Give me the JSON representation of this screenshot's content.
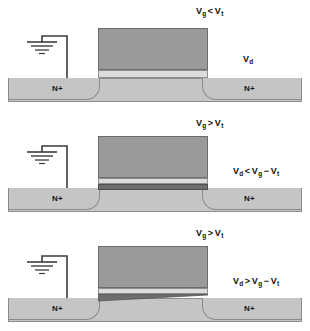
{
  "figure": {
    "colors": {
      "gate": "#9a9a9a",
      "oxide": "#dcdcdc",
      "substrate": "#c5c5c5",
      "channel": "#6e6e6e",
      "outline": "#8a8a8a",
      "background": "#ffffff"
    }
  },
  "panels": [
    {
      "id": "cutoff",
      "source_label": "N+",
      "drain_label": "N+",
      "gate_condition": {
        "v_gate": "V",
        "v_gate_sub": "g",
        "operator": "<",
        "v_thresh": "V",
        "v_thresh_sub": "t",
        "text": "Vg < Vt"
      },
      "drain_label_text": {
        "symbol": "V",
        "sub": "d",
        "text": "Vd"
      },
      "channel": "none"
    },
    {
      "id": "linear",
      "source_label": "N+",
      "drain_label": "N+",
      "gate_condition": {
        "v_gate": "V",
        "v_gate_sub": "g",
        "operator": ">",
        "v_thresh": "V",
        "v_thresh_sub": "t",
        "text": "Vg > Vt"
      },
      "drain_condition": {
        "v_drain": "V",
        "v_drain_sub": "d",
        "operator": "<",
        "v_gate": "V",
        "v_gate_sub": "g",
        "minus": "−",
        "v_thresh": "V",
        "v_thresh_sub": "t",
        "text": "Vd < Vg − Vt"
      },
      "channel": "uniform"
    },
    {
      "id": "saturation",
      "source_label": "N+",
      "drain_label": "N+",
      "gate_condition": {
        "v_gate": "V",
        "v_gate_sub": "g",
        "operator": ">",
        "v_thresh": "V",
        "v_thresh_sub": "t",
        "text": "Vg > Vt"
      },
      "drain_condition": {
        "v_drain": "V",
        "v_drain_sub": "d",
        "operator": ">",
        "v_gate": "V",
        "v_gate_sub": "g",
        "minus": "−",
        "v_thresh": "V",
        "v_thresh_sub": "t",
        "text": "Vd > Vg − Vt"
      },
      "channel": "tapered"
    }
  ]
}
